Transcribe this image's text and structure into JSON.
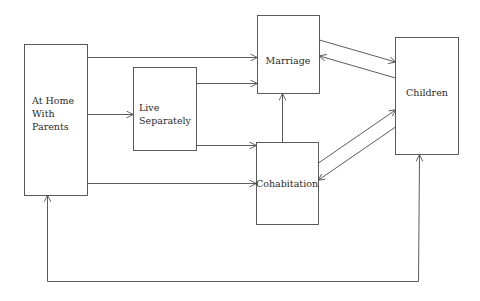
{
  "diagram": {
    "type": "flow",
    "colors": {
      "line": "#4a4a4a",
      "text": "#2a2a2a",
      "background": "#ffffff"
    },
    "nodes": {
      "home": {
        "lines": [
          "At Home",
          "With",
          "Parents"
        ]
      },
      "separate": {
        "lines": [
          "Live",
          "Separately"
        ]
      },
      "marriage": {
        "label": "Marriage"
      },
      "cohabitation": {
        "label": "Cohabitation"
      },
      "children": {
        "label": "Children"
      }
    },
    "edges": [
      {
        "from": "At Home With Parents",
        "to": "Marriage"
      },
      {
        "from": "At Home With Parents",
        "to": "Live Separately"
      },
      {
        "from": "At Home With Parents",
        "to": "Cohabitation"
      },
      {
        "from": "Live Separately",
        "to": "Marriage"
      },
      {
        "from": "Live Separately",
        "to": "Cohabitation"
      },
      {
        "from": "Cohabitation",
        "to": "Marriage"
      },
      {
        "from": "Marriage",
        "to": "Children"
      },
      {
        "from": "Children",
        "to": "Marriage"
      },
      {
        "from": "Cohabitation",
        "to": "Children"
      },
      {
        "from": "Children",
        "to": "Cohabitation"
      },
      {
        "from": "Children",
        "to": "At Home With Parents",
        "bidirectional": true
      }
    ]
  }
}
